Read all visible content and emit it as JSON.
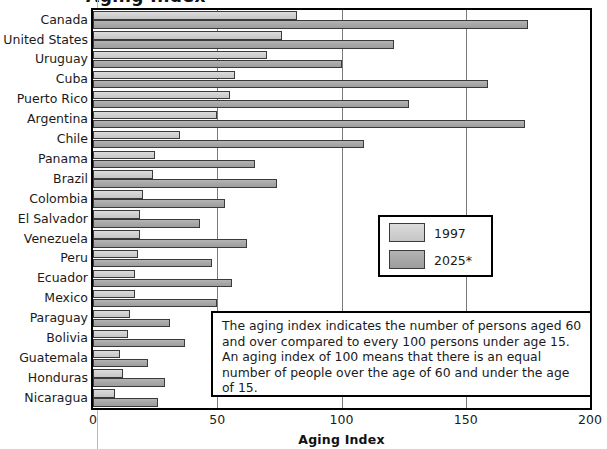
{
  "title_sliver": "Aging Index",
  "axis": {
    "xlabel": "Aging Index",
    "ticks": [
      "0",
      "50",
      "100",
      "150",
      "200"
    ]
  },
  "legend": {
    "items": [
      {
        "label": "1997",
        "color": "#cfcfcf"
      },
      {
        "label": "2025*",
        "color": "#a6a6a6"
      }
    ]
  },
  "note": {
    "text": "The aging index indicates the number of persons aged 60 and over compared to every 100 persons under age 15. An aging index of 100 means that there is an equal number of people over the age of 60 and under the age of 15."
  },
  "chart_data": {
    "type": "bar",
    "orientation": "horizontal",
    "title": "Aging Index",
    "xlabel": "Aging Index",
    "ylabel": "",
    "xlim": [
      0,
      200
    ],
    "xticks": [
      0,
      50,
      100,
      150,
      200
    ],
    "grid": true,
    "legend_position": "middle-right",
    "categories": [
      "Canada",
      "United States",
      "Uruguay",
      "Cuba",
      "Puerto Rico",
      "Argentina",
      "Chile",
      "Panama",
      "Brazil",
      "Colombia",
      "El Salvador",
      "Venezuela",
      "Peru",
      "Ecuador",
      "Mexico",
      "Paraguay",
      "Bolivia",
      "Guatemala",
      "Honduras",
      "Nicaragua"
    ],
    "series": [
      {
        "name": "1997",
        "color": "#cfcfcf",
        "values": [
          82,
          76,
          70,
          57,
          55,
          50,
          35,
          25,
          24,
          20,
          19,
          19,
          18,
          17,
          17,
          15,
          14,
          11,
          12,
          9
        ]
      },
      {
        "name": "2025*",
        "color": "#a6a6a6",
        "values": [
          175,
          121,
          100,
          159,
          127,
          174,
          109,
          65,
          74,
          53,
          43,
          62,
          48,
          56,
          50,
          31,
          37,
          22,
          29,
          26
        ]
      }
    ]
  }
}
